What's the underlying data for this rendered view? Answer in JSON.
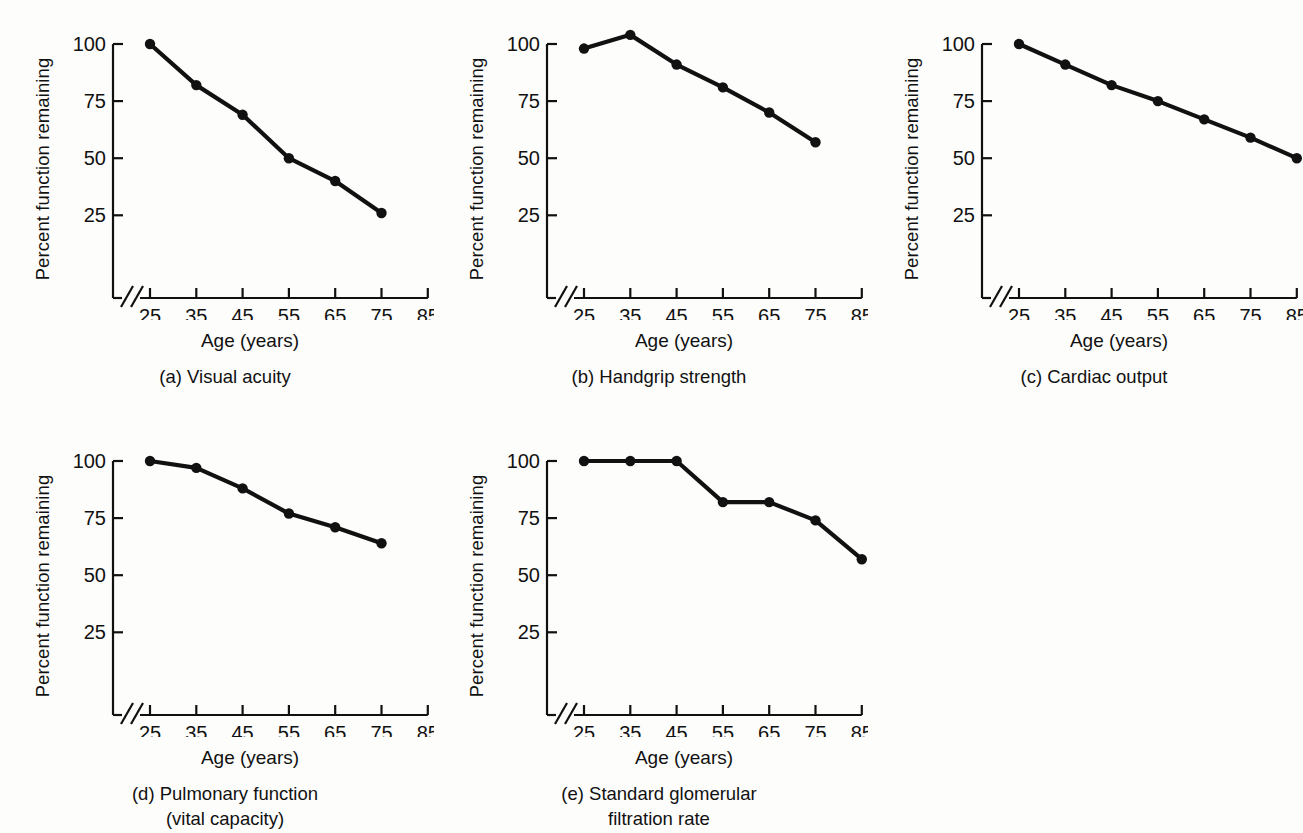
{
  "figure": {
    "background_color": "#fdfdfc",
    "line_color": "#111111",
    "axis_color": "#111111"
  },
  "common": {
    "ylabel": "Percent function remaining",
    "xlabel": "Age (years)",
    "ytick_labels": [
      "100",
      "75",
      "50",
      "25"
    ],
    "ytick_values": [
      100,
      75,
      50,
      25
    ],
    "xtick_labels": [
      "25",
      "35",
      "45",
      "55",
      "65",
      "75",
      "85"
    ],
    "xtick_values": [
      25,
      35,
      45,
      55,
      65,
      75,
      85
    ],
    "axis_break_symbol": "//"
  },
  "panels": [
    {
      "id": "a",
      "caption_line1": "(a) Visual acuity",
      "caption_line2": ""
    },
    {
      "id": "b",
      "caption_line1": "(b) Handgrip strength",
      "caption_line2": ""
    },
    {
      "id": "c",
      "caption_line1": "(c) Cardiac output",
      "caption_line2": ""
    },
    {
      "id": "d",
      "caption_line1": "(d) Pulmonary function",
      "caption_line2": "(vital capacity)"
    },
    {
      "id": "e",
      "caption_line1": "(e) Standard glomerular",
      "caption_line2": "filtration rate"
    }
  ],
  "chart_data": [
    {
      "type": "line",
      "title": "(a) Visual acuity",
      "xlabel": "Age (years)",
      "ylabel": "Percent function remaining",
      "x": [
        25,
        35,
        45,
        55,
        65,
        75
      ],
      "values": [
        100,
        82,
        69,
        50,
        40,
        26
      ],
      "xlim": [
        20,
        88
      ],
      "ylim": [
        0,
        108
      ],
      "xticks": [
        25,
        35,
        45,
        55,
        65,
        75,
        85
      ],
      "yticks": [
        25,
        50,
        75,
        100
      ],
      "grid": false,
      "legend": "none",
      "markers": "filled-circle"
    },
    {
      "type": "line",
      "title": "(b) Handgrip strength",
      "xlabel": "Age (years)",
      "ylabel": "Percent function remaining",
      "x": [
        25,
        35,
        45,
        55,
        65,
        75
      ],
      "values": [
        98,
        104,
        91,
        81,
        70,
        57
      ],
      "xlim": [
        20,
        88
      ],
      "ylim": [
        0,
        108
      ],
      "xticks": [
        25,
        35,
        45,
        55,
        65,
        75,
        85
      ],
      "yticks": [
        25,
        50,
        75,
        100
      ],
      "grid": false,
      "legend": "none",
      "markers": "filled-circle"
    },
    {
      "type": "line",
      "title": "(c) Cardiac output",
      "xlabel": "Age (years)",
      "ylabel": "Percent function remaining",
      "x": [
        25,
        35,
        45,
        55,
        65,
        75,
        85
      ],
      "values": [
        100,
        91,
        82,
        75,
        67,
        59,
        50
      ],
      "xlim": [
        20,
        88
      ],
      "ylim": [
        0,
        108
      ],
      "xticks": [
        25,
        35,
        45,
        55,
        65,
        75,
        85
      ],
      "yticks": [
        25,
        50,
        75,
        100
      ],
      "grid": false,
      "legend": "none",
      "markers": "filled-circle"
    },
    {
      "type": "line",
      "title": "(d) Pulmonary function (vital capacity)",
      "xlabel": "Age (years)",
      "ylabel": "Percent function remaining",
      "x": [
        25,
        35,
        45,
        55,
        65,
        75
      ],
      "values": [
        100,
        97,
        88,
        77,
        71,
        64
      ],
      "xlim": [
        20,
        88
      ],
      "ylim": [
        0,
        108
      ],
      "xticks": [
        25,
        35,
        45,
        55,
        65,
        75,
        85
      ],
      "yticks": [
        25,
        50,
        75,
        100
      ],
      "grid": false,
      "legend": "none",
      "markers": "filled-circle"
    },
    {
      "type": "line",
      "title": "(e) Standard glomerular filtration rate",
      "xlabel": "Age (years)",
      "ylabel": "Percent function remaining",
      "x": [
        25,
        35,
        45,
        55,
        65,
        75,
        85
      ],
      "values": [
        100,
        100,
        100,
        82,
        82,
        74,
        57
      ],
      "xlim": [
        20,
        88
      ],
      "ylim": [
        0,
        108
      ],
      "xticks": [
        25,
        35,
        45,
        55,
        65,
        75,
        85
      ],
      "yticks": [
        25,
        50,
        75,
        100
      ],
      "grid": false,
      "legend": "none",
      "markers": "filled-circle"
    }
  ]
}
